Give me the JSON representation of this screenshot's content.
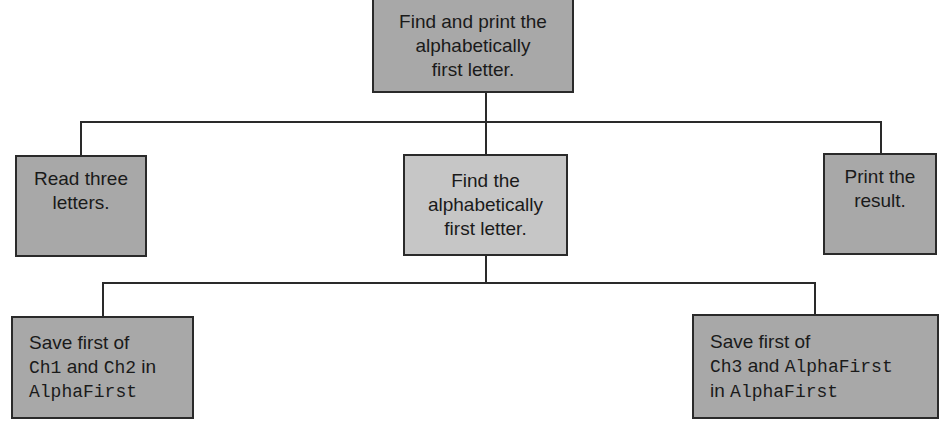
{
  "diagram": {
    "type": "hierarchy-chart",
    "root": {
      "id": "root",
      "lines": [
        "Find and print the",
        "alphabetically",
        "first letter."
      ]
    },
    "level1": [
      {
        "id": "read",
        "lines": [
          "Read three",
          "letters."
        ]
      },
      {
        "id": "find",
        "lines": [
          "Find the",
          "alphabetically",
          "first letter."
        ]
      },
      {
        "id": "print",
        "lines": [
          "Print the",
          "result."
        ]
      }
    ],
    "level2": [
      {
        "id": "save1",
        "line1": "Save first of",
        "line2_code1": "Ch1",
        "line2_text": " and ",
        "line2_code2": "Ch2",
        "line2_tail": " in",
        "line3_code": "AlphaFirst"
      },
      {
        "id": "save2",
        "line1": "Save first of",
        "line2_code1": "Ch3",
        "line2_text": " and ",
        "line2_code2": "AlphaFirst",
        "line3_text": "in ",
        "line3_code": "AlphaFirst"
      }
    ],
    "colors": {
      "box_dark": "#a8a8a8",
      "box_light": "#c6c6c6",
      "line": "#2a2a2a"
    }
  }
}
